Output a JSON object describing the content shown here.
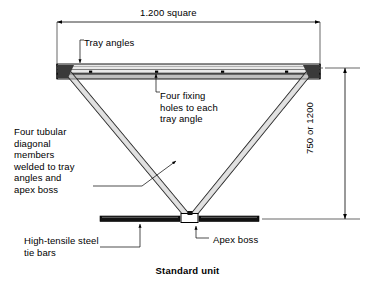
{
  "drawing": {
    "caption": "Standard unit",
    "background_color": "#ffffff",
    "line_color": "#000000",
    "hatch_color": "#9a9a9a",
    "dimensions": {
      "top": {
        "text": "1.200 square",
        "orientation": "horizontal"
      },
      "side": {
        "text": "750 or 1200",
        "orientation": "vertical"
      }
    },
    "annotations": {
      "tray_angles": "Tray angles",
      "fixing_holes": "Four fixing\nholes to each\ntray angle",
      "tubular_members": "Four tubular\ndiagonal\nmembers\nwelded to tray\nangles and\napex boss",
      "tie_bars": "High-tensile steel\ntie bars",
      "apex_boss": "Apex boss"
    },
    "components": {
      "tray": "tray-angle-beam",
      "diagonals": "tubular-diagonal-member",
      "tie_bar": "high-tensile-tie-bar",
      "boss": "apex-boss-block",
      "fixing_holes_count": 4
    }
  }
}
